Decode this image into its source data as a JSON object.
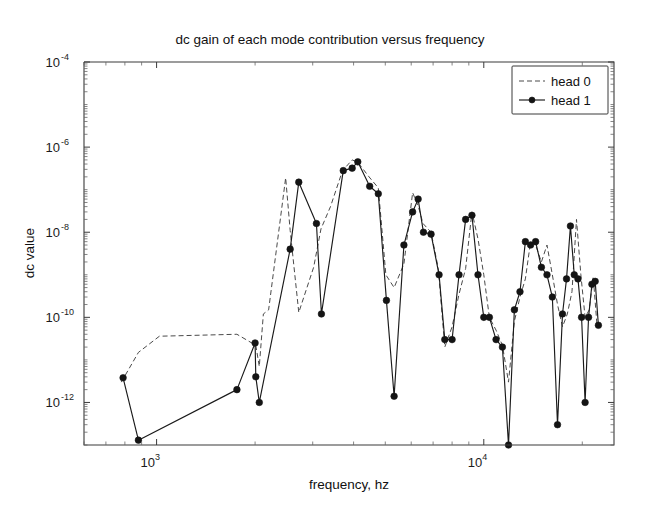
{
  "chart_data": {
    "type": "line",
    "title": "dc gain of each mode contribution versus frequency",
    "xlabel": "frequency, hz",
    "ylabel": "dc value",
    "xscale": "log",
    "yscale": "log",
    "xlim": [
      600,
      25000
    ],
    "ylim": [
      1e-13,
      0.0001
    ],
    "grid": false,
    "legend_position": "top-right",
    "xticks": [
      1000,
      10000
    ],
    "xtick_labels": [
      "10^3",
      "10^4"
    ],
    "yticks": [
      0.0001,
      1e-06,
      1e-08,
      1e-10,
      1e-12
    ],
    "ytick_labels": [
      "10^-4",
      "10^-6",
      "10^-8",
      "10^-10",
      "10^-12"
    ],
    "series": [
      {
        "name": "head 0",
        "style": "dashed",
        "marker": "none",
        "color": "#4a4a4a",
        "x": [
          780,
          880,
          1020,
          1760,
          2010,
          2060,
          2120,
          2200,
          2480,
          2560,
          2720,
          3020,
          3180,
          3400,
          3700,
          3960,
          4120,
          4460,
          4760,
          5020,
          5320,
          5700,
          6060,
          6300,
          6520,
          6900,
          7260,
          7600,
          8000,
          8400,
          8800,
          9200,
          9600,
          10000,
          10400,
          10900,
          11400,
          11900,
          12400,
          12900,
          13400,
          13900,
          14400,
          15000,
          15600,
          16200,
          16800,
          17400,
          18000,
          18600,
          19200,
          19800,
          20400,
          21000,
          21600,
          22200
        ],
        "y": [
          3e-12,
          1.5e-11,
          3.6e-11,
          4e-11,
          2.2e-11,
          7e-12,
          1.2e-10,
          1.5e-10,
          1.9e-07,
          1.1e-08,
          1.3e-10,
          1.5e-09,
          1.2e-08,
          4e-08,
          2.8e-07,
          5e-07,
          4.4e-07,
          2e-07,
          1.1e-07,
          1e-09,
          5e-10,
          1.8e-09,
          8.5e-08,
          4.2e-08,
          1.6e-08,
          1e-08,
          1.4e-09,
          2e-11,
          6e-11,
          3.5e-10,
          1.4e-09,
          3e-08,
          7e-09,
          1e-09,
          1e-10,
          5e-11,
          2.2e-11,
          3e-12,
          8e-11,
          3e-10,
          8e-10,
          6e-09,
          5e-09,
          2e-09,
          5e-09,
          1e-09,
          2e-10,
          6e-11,
          1.2e-10,
          4e-10,
          2e-08,
          1e-09,
          1e-10,
          1.5e-10,
          9e-10,
          6e-11
        ]
      },
      {
        "name": "head 1",
        "style": "solid",
        "marker": "circle",
        "color": "#141414",
        "x": [
          790,
          880,
          1760,
          2000,
          2010,
          2060,
          2560,
          2720,
          3080,
          3190,
          3720,
          3960,
          4120,
          4480,
          4760,
          5040,
          5320,
          5700,
          6060,
          6300,
          6540,
          6900,
          7300,
          7600,
          8000,
          8400,
          8800,
          9200,
          9600,
          10000,
          10400,
          10900,
          11400,
          11900,
          12400,
          12900,
          13400,
          13900,
          14400,
          15000,
          15600,
          16200,
          16800,
          17400,
          17900,
          18400,
          18900,
          19400,
          19900,
          20400,
          20900,
          21400,
          21900,
          22400
        ],
        "y": [
          3.8e-12,
          1.3e-13,
          2e-12,
          2.5e-11,
          4e-12,
          1e-12,
          4e-09,
          1.5e-07,
          1.6e-08,
          1.2e-10,
          2.8e-07,
          3.2e-07,
          4.5e-07,
          1.2e-07,
          8e-08,
          2.5e-10,
          1.4e-12,
          5e-09,
          3e-08,
          6e-08,
          1e-08,
          9e-09,
          1e-09,
          3e-11,
          3e-11,
          1e-09,
          2e-08,
          2.5e-08,
          1e-09,
          1e-10,
          1e-10,
          3e-11,
          2e-11,
          4e-14,
          1.5e-10,
          4e-10,
          6e-09,
          5e-09,
          6e-09,
          1.5e-09,
          1e-09,
          3e-10,
          3e-13,
          1.2e-10,
          8e-10,
          1.4e-08,
          1e-09,
          8e-10,
          1e-10,
          1e-12,
          1e-10,
          6e-10,
          7e-10,
          6.5e-11
        ]
      }
    ]
  },
  "legend": {
    "entries": [
      {
        "label": "head 0"
      },
      {
        "label": "head 1"
      }
    ]
  }
}
